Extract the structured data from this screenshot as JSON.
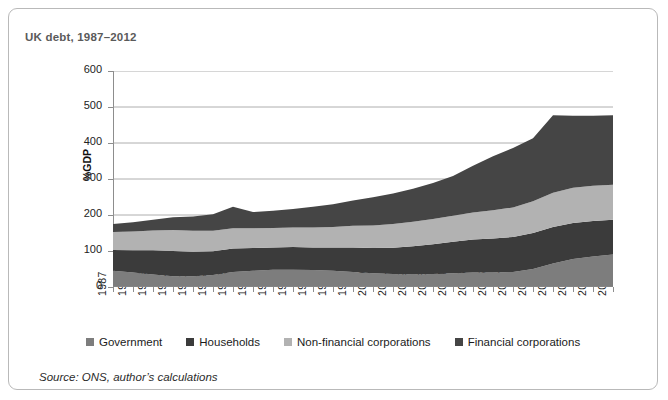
{
  "figure": {
    "title": "UK debt, 1987–2012",
    "source": "Source: ONS, author’s calculations"
  },
  "chart_data": {
    "type": "area",
    "title": "UK debt, 1987–2012",
    "xlabel": "",
    "ylabel": "%GDP",
    "ylim": [
      0,
      600
    ],
    "yticks": [
      0,
      100,
      200,
      300,
      400,
      500,
      600
    ],
    "grid": true,
    "stacked": true,
    "legend_position": "bottom",
    "categories": [
      "1987",
      "1988",
      "1989",
      "1990",
      "1991",
      "1992",
      "1993",
      "1994",
      "1995",
      "1996",
      "1997",
      "1998",
      "1999",
      "2000",
      "2001",
      "2002",
      "2003",
      "2004",
      "2005",
      "2006",
      "2007",
      "2008",
      "2009",
      "2010",
      "2011",
      "2012"
    ],
    "series": [
      {
        "name": "Government",
        "color": "#7d7d7d",
        "values": [
          45,
          40,
          35,
          30,
          30,
          33,
          42,
          45,
          48,
          48,
          47,
          45,
          42,
          38,
          36,
          35,
          36,
          38,
          40,
          40,
          42,
          50,
          65,
          78,
          85,
          90
        ]
      },
      {
        "name": "Households",
        "color": "#3b3b3b",
        "values": [
          58,
          62,
          67,
          70,
          68,
          66,
          65,
          63,
          62,
          63,
          63,
          65,
          68,
          70,
          73,
          78,
          83,
          88,
          92,
          95,
          97,
          100,
          102,
          100,
          98,
          97
        ]
      },
      {
        "name": "Non-financial corporations",
        "color": "#b2b2b2",
        "values": [
          50,
          52,
          55,
          58,
          58,
          57,
          56,
          55,
          54,
          54,
          55,
          57,
          60,
          63,
          66,
          68,
          70,
          72,
          75,
          78,
          82,
          88,
          95,
          98,
          98,
          97
        ]
      },
      {
        "name": "Financial corporations",
        "color": "#454545",
        "values": [
          22,
          26,
          30,
          36,
          40,
          46,
          60,
          45,
          48,
          52,
          58,
          63,
          70,
          78,
          85,
          92,
          100,
          110,
          130,
          150,
          165,
          175,
          215,
          200,
          195,
          193
        ]
      }
    ],
    "totals": [
      175,
      180,
      187,
      194,
      196,
      202,
      223,
      208,
      212,
      217,
      223,
      230,
      240,
      249,
      260,
      273,
      289,
      308,
      337,
      363,
      386,
      413,
      477,
      476,
      476,
      477
    ]
  },
  "legend": {
    "items": [
      {
        "label": "Government",
        "color": "#7d7d7d"
      },
      {
        "label": "Households",
        "color": "#3b3b3b"
      },
      {
        "label": "Non-financial corporations",
        "color": "#b2b2b2"
      },
      {
        "label": "Financial corporations",
        "color": "#454545"
      }
    ]
  }
}
